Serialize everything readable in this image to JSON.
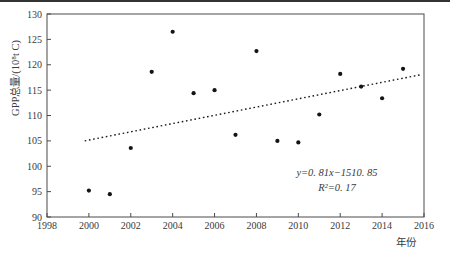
{
  "page": {
    "background": "#ffffff",
    "top_rule_color": "#333333"
  },
  "chart_data": {
    "type": "scatter",
    "title": "",
    "xlabel": "年份",
    "ylabel": "GPP总量/(10⁸t C)",
    "xlim": [
      1998,
      2016
    ],
    "ylim": [
      90,
      130
    ],
    "xticks": [
      1998,
      2000,
      2002,
      2004,
      2006,
      2008,
      2010,
      2012,
      2014,
      2016
    ],
    "yticks": [
      90,
      95,
      100,
      105,
      110,
      115,
      120,
      125,
      130
    ],
    "grid": false,
    "legend": false,
    "axis_color": "#4a4a4a",
    "text_color": "#3a3a3a",
    "marker": {
      "shape": "circle-filled",
      "color": "#141414",
      "radius": 2.1
    },
    "x": [
      2000,
      2001,
      2002,
      2003,
      2004,
      2005,
      2006,
      2007,
      2008,
      2009,
      2010,
      2011,
      2012,
      2013,
      2014,
      2015
    ],
    "values": [
      95.2,
      94.5,
      103.6,
      118.6,
      126.5,
      114.4,
      115.0,
      106.2,
      122.7,
      105.0,
      104.7,
      110.2,
      118.2,
      115.7,
      113.4,
      119.2
    ],
    "trendline": {
      "style": "dotted",
      "color": "#1a1a1a",
      "slope": 0.81,
      "x_start": 1999.8,
      "y_start": 105.0,
      "x_end": 2015.8,
      "y_end": 118.0,
      "equation": "y=0. 81x−1510. 85",
      "r_squared": "R²=0. 17"
    }
  }
}
